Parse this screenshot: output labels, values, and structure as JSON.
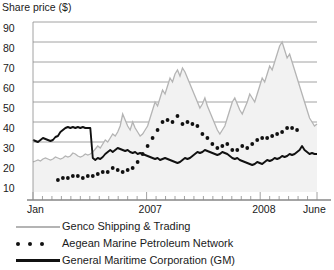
{
  "chart_data": {
    "type": "line",
    "title": "Share price ($)",
    "xlabel": "",
    "ylabel": "Share price ($)",
    "ylim": [
      5,
      90
    ],
    "yticks": [
      10,
      20,
      30,
      40,
      50,
      60,
      70,
      80,
      90
    ],
    "ytick_labels": [
      "10",
      "20",
      "30",
      "40",
      "50",
      "60",
      "70",
      "80",
      "90"
    ],
    "xlim": [
      "Jan 2006",
      "June 2008"
    ],
    "xtick_labels": [
      "Jan",
      "2007",
      "2008",
      "June"
    ],
    "xtick_positions": [
      0.02,
      0.42,
      0.82,
      0.99
    ],
    "grid": "horizontal",
    "legend_position": "below",
    "series": [
      {
        "name": "Genco Shipping & Trading",
        "style": "line",
        "color": "#b4b4b4",
        "fill": "#f2f2f2",
        "values": [
          20,
          20.5,
          21,
          20.5,
          21.5,
          22,
          21.5,
          21,
          21.5,
          22.5,
          22,
          21.5,
          22,
          23,
          22.5,
          23,
          24.5,
          24,
          23,
          22.5,
          23,
          24,
          23.5,
          24,
          25,
          26.5,
          28,
          27,
          29,
          31,
          30,
          32,
          34,
          33,
          35,
          38,
          44,
          41,
          38,
          36,
          40,
          37,
          35,
          33,
          34,
          36,
          38,
          42,
          46,
          50,
          48,
          52,
          56,
          54,
          58,
          62,
          60,
          64,
          66,
          63,
          67,
          65,
          62,
          59,
          56,
          53,
          50,
          47,
          49,
          52,
          48,
          45,
          42,
          39,
          36,
          34,
          36,
          38,
          42,
          46,
          50,
          52,
          49,
          46,
          44,
          47,
          50,
          54,
          52,
          50,
          54,
          58,
          62,
          60,
          64,
          68,
          66,
          70,
          74,
          78,
          80,
          76,
          72,
          74,
          70,
          66,
          62,
          58,
          54,
          50,
          46,
          42,
          40,
          38,
          39
        ]
      },
      {
        "name": "Aegean Marine Petroleum Network",
        "style": "dotted",
        "color": "#111111",
        "values": [
          null,
          null,
          null,
          null,
          null,
          null,
          null,
          null,
          null,
          null,
          11,
          11.5,
          12,
          12.5,
          12,
          12.5,
          13,
          12.5,
          13,
          12.5,
          12,
          12.5,
          13,
          13.5,
          13,
          13.5,
          14,
          14.5,
          15,
          14.5,
          15,
          16,
          17,
          16.5,
          16,
          15.5,
          15,
          15.5,
          16,
          16.5,
          17,
          18,
          20,
          22,
          24,
          26,
          28,
          30,
          32,
          34,
          36,
          38,
          40,
          42,
          41,
          39,
          40,
          42,
          43,
          41,
          39,
          38,
          40,
          41,
          39,
          37,
          38,
          36,
          34,
          33,
          32,
          30,
          29,
          28,
          27,
          26,
          28,
          30,
          29,
          27,
          26,
          25,
          26,
          27,
          28,
          26,
          27,
          28,
          29,
          30,
          31,
          30,
          32,
          33,
          32,
          34,
          33,
          35,
          34,
          36,
          35,
          36,
          37,
          36,
          37,
          36,
          36
        ]
      },
      {
        "name": "General Maritime Corporation (GM)",
        "style": "line",
        "color": "#111111",
        "values": [
          31,
          30.5,
          30,
          31,
          32,
          31.5,
          31,
          30.5,
          31,
          32.5,
          33,
          35,
          36,
          37,
          37.5,
          37,
          37.5,
          37,
          37.5,
          37,
          37.5,
          37,
          37,
          37,
          22,
          21,
          22,
          21.5,
          22.5,
          24,
          25,
          26,
          25,
          26,
          27,
          26.5,
          26,
          25.5,
          26,
          25,
          24.5,
          25,
          24,
          24.5,
          24,
          23.5,
          23,
          22.5,
          22,
          21.5,
          22,
          21,
          21.5,
          22,
          21.5,
          21,
          20.5,
          20,
          19.5,
          20,
          21,
          22,
          21.5,
          22,
          23,
          24,
          25,
          24.5,
          25,
          26,
          25.5,
          25,
          24.5,
          24,
          23.5,
          24,
          25,
          24.5,
          24,
          23,
          22,
          21.5,
          22,
          21,
          20.5,
          20,
          19.5,
          19,
          18.5,
          19,
          20,
          19.5,
          19,
          20,
          21,
          20.5,
          21,
          22,
          21.5,
          22,
          23,
          22.5,
          23,
          24,
          23.5,
          24,
          25,
          26,
          28,
          26,
          25,
          24,
          24.5,
          24,
          24
        ]
      }
    ]
  }
}
